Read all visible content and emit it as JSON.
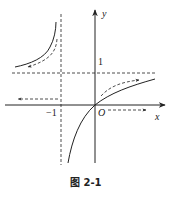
{
  "figure": {
    "caption": "图 2-1",
    "axes": {
      "x_label": "x",
      "y_label": "y",
      "origin_label": "O",
      "tick_y": "1",
      "tick_x": "−1"
    },
    "asymptotes": {
      "vertical": "x = -1",
      "horizontal": "y = 1"
    },
    "function": "y = x/(x+1)",
    "colors": {
      "stroke": "#222222",
      "background": "#ffffff"
    }
  }
}
